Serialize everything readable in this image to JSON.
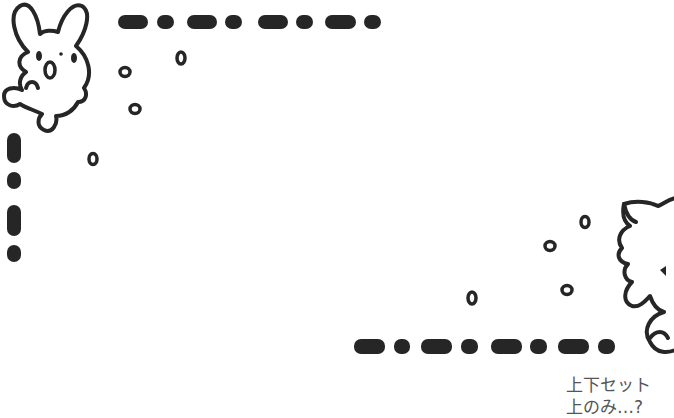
{
  "illustration": {
    "description": "Frame decoration with rabbit (top-left) and sheep-like creature (bottom-right), dashed borders and small circles",
    "ink_color": "#222222",
    "background": "#ffffff"
  },
  "caption": {
    "line1": "上下セット",
    "line2": "上のみ…?"
  }
}
